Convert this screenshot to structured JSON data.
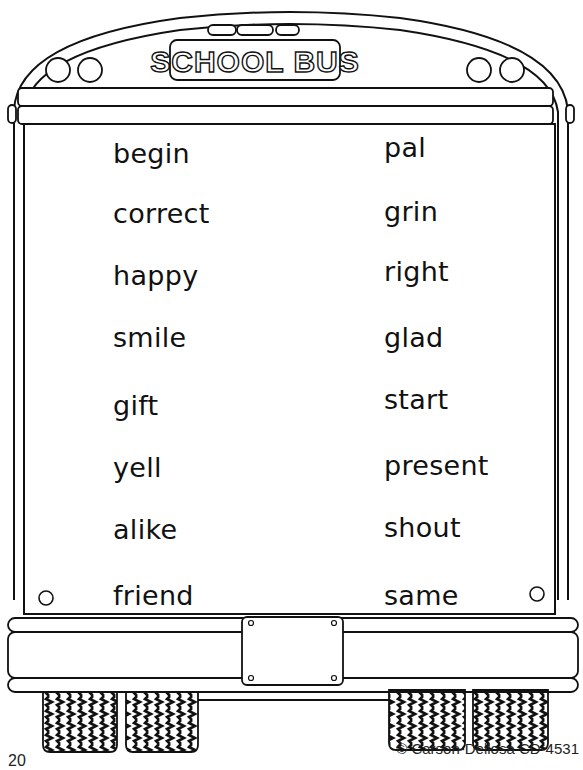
{
  "bus": {
    "sign_text": "SCHOOL BUS"
  },
  "words": {
    "left": [
      "begin",
      "correct",
      "happy",
      "smile",
      "gift",
      "yell",
      "alike",
      "friend"
    ],
    "right": [
      "pal",
      "grin",
      "right",
      "glad",
      "start",
      "present",
      "shout",
      "same"
    ]
  },
  "footer": {
    "page_number": "20",
    "copyright": "© Carson-Dellosa CD-4531"
  }
}
